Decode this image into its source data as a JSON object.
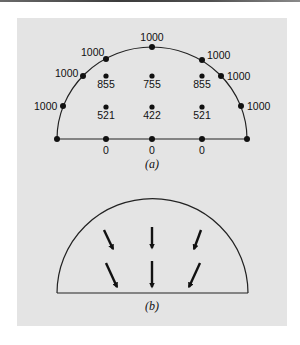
{
  "figure": {
    "panel_a": {
      "caption": "(a)",
      "boundary_nodes": [
        {
          "x": 57,
          "y": 139,
          "label": ""
        },
        {
          "x": 63,
          "y": 106,
          "label": "1000",
          "lx": 34,
          "ly": 110,
          "anchor": "start"
        },
        {
          "x": 83,
          "y": 76,
          "label": "1000",
          "lx": 55,
          "ly": 77,
          "anchor": "start"
        },
        {
          "x": 106,
          "y": 59,
          "label": "1000",
          "lx": 81,
          "ly": 56,
          "anchor": "start"
        },
        {
          "x": 152,
          "y": 47,
          "label": "1000",
          "lx": 152,
          "ly": 41,
          "anchor": "middle"
        },
        {
          "x": 202,
          "y": 60,
          "label": "1000",
          "lx": 207,
          "ly": 59,
          "anchor": "start"
        },
        {
          "x": 221,
          "y": 76,
          "label": "1000",
          "lx": 227,
          "ly": 80,
          "anchor": "start"
        },
        {
          "x": 241,
          "y": 106,
          "label": "1000",
          "lx": 247,
          "ly": 110,
          "anchor": "start"
        },
        {
          "x": 247,
          "y": 139,
          "label": ""
        }
      ],
      "interior_nodes": [
        {
          "x": 106,
          "y": 76,
          "label": "855"
        },
        {
          "x": 152,
          "y": 76,
          "label": "755"
        },
        {
          "x": 202,
          "y": 76,
          "label": "855"
        },
        {
          "x": 106,
          "y": 107,
          "label": "521"
        },
        {
          "x": 152,
          "y": 107,
          "label": "422"
        },
        {
          "x": 202,
          "y": 107,
          "label": "521"
        }
      ],
      "base_nodes": [
        {
          "x": 106,
          "y": 139,
          "label": "0"
        },
        {
          "x": 152,
          "y": 139,
          "label": "0"
        },
        {
          "x": 202,
          "y": 139,
          "label": "0"
        }
      ]
    },
    "panel_b": {
      "caption": "(b)",
      "arrows": [
        {
          "x1": 104,
          "y1": 230,
          "x2": 113,
          "y2": 249
        },
        {
          "x1": 152,
          "y1": 227,
          "x2": 152,
          "y2": 248
        },
        {
          "x1": 201,
          "y1": 230,
          "x2": 194,
          "y2": 249
        },
        {
          "x1": 106,
          "y1": 263,
          "x2": 117,
          "y2": 287
        },
        {
          "x1": 152,
          "y1": 261,
          "x2": 152,
          "y2": 287
        },
        {
          "x1": 200,
          "y1": 263,
          "x2": 189,
          "y2": 287
        }
      ]
    },
    "colors": {
      "panel": "#e4e4e4",
      "ink": "#111111"
    }
  }
}
